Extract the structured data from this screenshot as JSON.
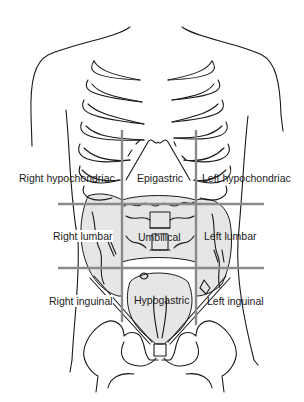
{
  "diagram": {
    "grid_color": "#8a8a8a",
    "line_color": "#1a1a1a",
    "shade_color": "#e6e6e6",
    "regions": [
      {
        "id": "right-hypochondriac",
        "label": "Right hypochondriac",
        "row": 1,
        "col": 1
      },
      {
        "id": "epigastric",
        "label": "Epigastric",
        "row": 1,
        "col": 2
      },
      {
        "id": "left-hypochondriac",
        "label": "Left hypochondriac",
        "row": 1,
        "col": 3
      },
      {
        "id": "right-lumbar",
        "label": "Right lumbar",
        "row": 2,
        "col": 1
      },
      {
        "id": "umbilical",
        "label": "Umbilical",
        "row": 2,
        "col": 2
      },
      {
        "id": "left-lumbar",
        "label": "Left lumbar",
        "row": 2,
        "col": 3
      },
      {
        "id": "right-inguinal",
        "label": "Right inguinal",
        "row": 3,
        "col": 1
      },
      {
        "id": "hypogastric",
        "label": "Hypogastric",
        "row": 3,
        "col": 2
      },
      {
        "id": "left-inguinal",
        "label": "Left inguinal",
        "row": 3,
        "col": 3
      }
    ]
  }
}
